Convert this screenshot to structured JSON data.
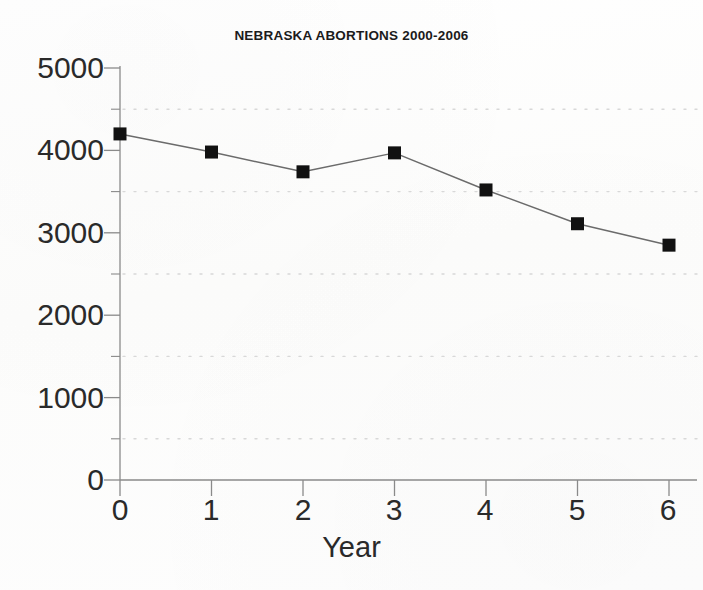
{
  "chart_data": {
    "type": "line",
    "title": "NEBRASKA ABORTIONS 2000-2006",
    "xlabel": "Year",
    "ylabel": "",
    "x": [
      0,
      1,
      2,
      3,
      4,
      5,
      6
    ],
    "values": [
      4200,
      3980,
      3740,
      3970,
      3520,
      3110,
      2850
    ],
    "series": [
      {
        "name": "Nebraska abortions",
        "values": [
          4200,
          3980,
          3740,
          3970,
          3520,
          3110,
          2850
        ]
      }
    ],
    "xlim": [
      0,
      6
    ],
    "ylim": [
      0,
      5000
    ],
    "xticks": [
      "0",
      "1",
      "2",
      "3",
      "4",
      "5",
      "6"
    ],
    "yticks": [
      "0",
      "1000",
      "2000",
      "3000",
      "4000",
      "5000"
    ],
    "y_minor_ticks": [
      500,
      1500,
      2500,
      3500,
      4500
    ],
    "gridlines": [
      500,
      1500,
      2500,
      3500,
      4500
    ],
    "grid": "horizontal-dotted",
    "legend": "none",
    "marker": "filled-square",
    "marker_color": "#111111",
    "line_color": "#6b6b6b",
    "axis_color": "#8a8a8a",
    "grid_color": "#d8d8d8",
    "background_color": "#fdfdfd"
  },
  "axes": {
    "y_labels": [
      "5000",
      "4000",
      "3000",
      "2000",
      "1000",
      "0"
    ],
    "x_labels": [
      "0",
      "1",
      "2",
      "3",
      "4",
      "5",
      "6"
    ]
  }
}
